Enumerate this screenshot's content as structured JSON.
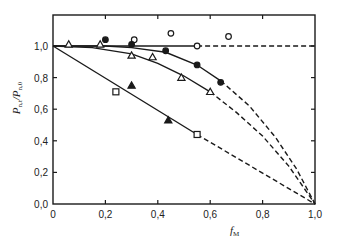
{
  "chart_data": {
    "type": "scatter",
    "title": "",
    "xlabel": "f_М",
    "ylabel": "P_n,t / P_n,0",
    "xlim": [
      0,
      1.0
    ],
    "ylim": [
      0,
      1.15
    ],
    "grid": false,
    "legend": null,
    "x_ticks": [
      "0",
      "0,2",
      "0,4",
      "0,6",
      "0,8",
      "1,0"
    ],
    "y_ticks": [
      "0,0",
      "0,2",
      "0,4",
      "0,6",
      "0,8",
      "1,0"
    ],
    "series": [
      {
        "name": "open circles",
        "marker": "open-circle",
        "x": [
          0.31,
          0.45,
          0.55,
          0.67
        ],
        "y": [
          1.04,
          1.08,
          1.0,
          1.06
        ]
      },
      {
        "name": "filled circles",
        "marker": "filled-circle",
        "x": [
          0.2,
          0.3,
          0.43,
          0.55,
          0.64
        ],
        "y": [
          1.04,
          1.01,
          0.97,
          0.88,
          0.77
        ]
      },
      {
        "name": "open triangles",
        "marker": "open-triangle",
        "x": [
          0.06,
          0.18,
          0.3,
          0.38,
          0.49,
          0.6
        ],
        "y": [
          1.01,
          1.01,
          0.94,
          0.93,
          0.8,
          0.71
        ]
      },
      {
        "name": "filled triangles",
        "marker": "filled-triangle",
        "x": [
          0.3,
          0.44
        ],
        "y": [
          0.75,
          0.53
        ]
      },
      {
        "name": "open squares",
        "marker": "open-square",
        "x": [
          0.24,
          0.55
        ],
        "y": [
          0.71,
          0.44
        ]
      }
    ],
    "fit_lines": [
      {
        "name": "horizontal",
        "solid_to": 0.55,
        "points": [
          [
            0,
            1.0
          ],
          [
            0.55,
            1.0
          ],
          [
            1.0,
            1.0
          ]
        ]
      },
      {
        "name": "filled-circle curve",
        "solid_to": 0.64,
        "points": [
          [
            0,
            1.0
          ],
          [
            0.2,
            1.0
          ],
          [
            0.3,
            0.99
          ],
          [
            0.43,
            0.96
          ],
          [
            0.55,
            0.88
          ],
          [
            0.64,
            0.78
          ],
          [
            0.75,
            0.62
          ],
          [
            0.85,
            0.42
          ],
          [
            0.93,
            0.22
          ],
          [
            1.0,
            0.0
          ]
        ]
      },
      {
        "name": "open-triangle curve",
        "solid_to": 0.6,
        "points": [
          [
            0,
            1.0
          ],
          [
            0.15,
            0.99
          ],
          [
            0.3,
            0.95
          ],
          [
            0.4,
            0.89
          ],
          [
            0.5,
            0.81
          ],
          [
            0.6,
            0.71
          ],
          [
            0.7,
            0.58
          ],
          [
            0.8,
            0.43
          ],
          [
            0.9,
            0.24
          ],
          [
            1.0,
            0.0
          ]
        ]
      },
      {
        "name": "straight",
        "solid_to": 0.55,
        "points": [
          [
            0,
            1.0
          ],
          [
            0.55,
            0.44
          ],
          [
            1.0,
            0.0
          ]
        ]
      }
    ]
  }
}
